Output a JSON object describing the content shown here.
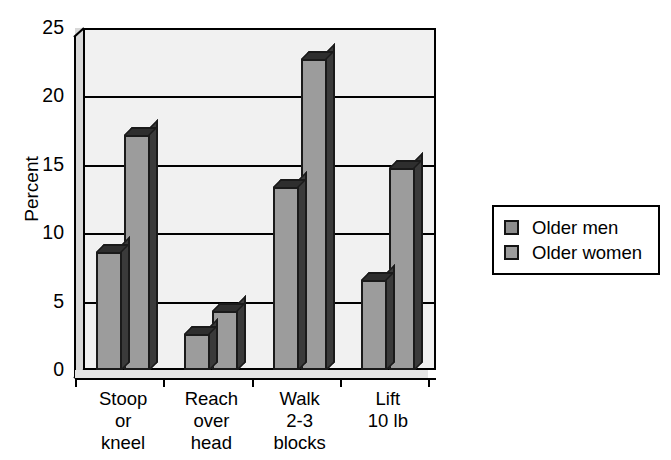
{
  "chart_data": {
    "type": "bar",
    "title": "",
    "subtitle": "",
    "xlabel": "",
    "ylabel": "Percent",
    "ylim": [
      0,
      25
    ],
    "yticks": [
      0,
      5,
      10,
      15,
      20,
      25
    ],
    "ytick_labels": [
      "0",
      "5",
      "10",
      "15",
      "20",
      "25"
    ],
    "grid": true,
    "grid_axis": "y",
    "legend_position": "right",
    "style": "3d-bar",
    "categories": [
      "Stoop or kneel",
      "Reach over head",
      "Walk 2-3 blocks",
      "Lift 10 lb"
    ],
    "category_lines": [
      [
        "Stoop",
        "or",
        "kneel"
      ],
      [
        "Reach",
        "over",
        "head"
      ],
      [
        "Walk",
        "2-3",
        "blocks"
      ],
      [
        "Lift",
        "10 lb"
      ]
    ],
    "series": [
      {
        "name": "Older men",
        "color": "#9c9c9c",
        "values": [
          8.6,
          2.6,
          13.4,
          6.6
        ]
      },
      {
        "name": "Older women",
        "color": "#9c9c9c",
        "values": [
          17.2,
          4.3,
          22.7,
          14.8
        ]
      }
    ]
  },
  "legend": {
    "items": [
      {
        "label": "Older men"
      },
      {
        "label": "Older women"
      }
    ]
  },
  "axes": {
    "y_title": "Percent"
  },
  "colors": {
    "bar_face": "#9c9c9c",
    "bar_side": "#3a3a3a",
    "bar_edge": "#1a1a1a",
    "plot_background": "#f1f1f1",
    "wall": "#d8d8d8",
    "axis": "#000000",
    "page_background": "#ffffff"
  }
}
